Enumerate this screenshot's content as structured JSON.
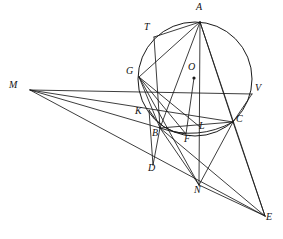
{
  "figure": {
    "type": "euclidean-geometry-diagram",
    "stroke_color": "#1a1a1a",
    "background_color": "#ffffff",
    "canvas": {
      "width": 283,
      "height": 239
    },
    "circle": {
      "label": "circumcircle",
      "cx": 195,
      "cy": 79,
      "r": 57
    },
    "center_dot": {
      "label": "O",
      "x": 194,
      "y": 78,
      "r": 1.6
    },
    "points": [
      {
        "id": "A",
        "label": "A",
        "x": 200,
        "y": 22,
        "lx": 196,
        "ly": 2,
        "on_circle": true
      },
      {
        "id": "T",
        "label": "T",
        "x": 154,
        "y": 37,
        "lx": 144,
        "ly": 22,
        "on_circle": true
      },
      {
        "id": "G",
        "label": "G",
        "x": 139,
        "y": 77,
        "lx": 126,
        "ly": 66,
        "on_circle": true
      },
      {
        "id": "O",
        "label": "O",
        "x": 194,
        "y": 78,
        "lx": 188,
        "ly": 62,
        "on_circle": false
      },
      {
        "id": "V",
        "label": "V",
        "x": 252,
        "y": 94,
        "lx": 255,
        "ly": 83,
        "on_circle": true
      },
      {
        "id": "K",
        "label": "K",
        "x": 149,
        "y": 110,
        "lx": 135,
        "ly": 106,
        "on_circle": false
      },
      {
        "id": "B",
        "label": "B",
        "x": 160,
        "y": 128,
        "lx": 152,
        "ly": 128,
        "on_circle": true
      },
      {
        "id": "L",
        "label": "L",
        "x": 200,
        "y": 127,
        "lx": 199,
        "ly": 121,
        "on_circle": false
      },
      {
        "id": "C",
        "label": "C",
        "x": 233,
        "y": 122,
        "lx": 236,
        "ly": 114,
        "on_circle": true
      },
      {
        "id": "F",
        "label": "F",
        "x": 186,
        "y": 134,
        "lx": 184,
        "ly": 134,
        "on_circle": false
      },
      {
        "id": "D",
        "label": "D",
        "x": 153,
        "y": 165,
        "lx": 148,
        "ly": 163,
        "on_circle": false
      },
      {
        "id": "N",
        "label": "N",
        "x": 199,
        "y": 185,
        "lx": 194,
        "ly": 185,
        "on_circle": true
      },
      {
        "id": "M",
        "label": "M",
        "x": 30,
        "y": 90,
        "lx": 9,
        "ly": 80,
        "on_circle": false
      },
      {
        "id": "E",
        "label": "E",
        "x": 265,
        "y": 216,
        "lx": 266,
        "ly": 212,
        "on_circle": false
      }
    ],
    "segments": [
      {
        "name": "M-T-V",
        "from": "M",
        "to": "V",
        "via": "T"
      },
      {
        "name": "M-K-C",
        "from": "M",
        "to": "C",
        "via": "K"
      },
      {
        "name": "M-B",
        "from": "M",
        "to": "B"
      },
      {
        "name": "M-N-E",
        "from": "M",
        "to": "E",
        "via": "N"
      },
      {
        "name": "A-T",
        "from": "A",
        "to": "T"
      },
      {
        "name": "A-G",
        "from": "A",
        "to": "G"
      },
      {
        "name": "A-B",
        "from": "A",
        "to": "B"
      },
      {
        "name": "A-N",
        "from": "A",
        "to": "N"
      },
      {
        "name": "A-C",
        "from": "A",
        "to": "C"
      },
      {
        "name": "A-E",
        "from": "A",
        "to": "E"
      },
      {
        "name": "T-B",
        "from": "T",
        "to": "B"
      },
      {
        "name": "G-B",
        "from": "G",
        "to": "B"
      },
      {
        "name": "G-L",
        "from": "G",
        "to": "L"
      },
      {
        "name": "G-F",
        "from": "G",
        "to": "F"
      },
      {
        "name": "G-N",
        "from": "G",
        "to": "N"
      },
      {
        "name": "B-C",
        "from": "B",
        "to": "C"
      },
      {
        "name": "B-D",
        "from": "B",
        "to": "D"
      },
      {
        "name": "B-N",
        "from": "B",
        "to": "N"
      },
      {
        "name": "B-E",
        "from": "B",
        "to": "E"
      },
      {
        "name": "K-D",
        "from": "K",
        "to": "D"
      },
      {
        "name": "C-N",
        "from": "C",
        "to": "N"
      },
      {
        "name": "C-E",
        "from": "C",
        "to": "E"
      },
      {
        "name": "V-C",
        "from": "V",
        "to": "C"
      },
      {
        "name": "N-E",
        "from": "N",
        "to": "E"
      },
      {
        "name": "O-F",
        "from": "O",
        "to": "F"
      }
    ],
    "arcs": [
      {
        "name": "arc-B-L-C",
        "from": "B",
        "to": "C",
        "sagitta": 8
      },
      {
        "name": "arc-K-F",
        "from": "K",
        "to": "F",
        "sagitta": 6
      }
    ]
  }
}
